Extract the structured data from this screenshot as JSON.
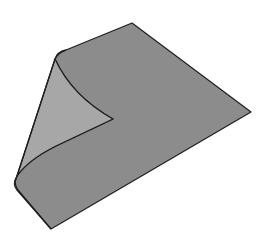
{
  "illustration": {
    "subject": "sheet with curled corner",
    "colors": {
      "background": "#ffffff",
      "top_surface": "#8c8c8c",
      "underside": "#a7a7a7",
      "outline": "#1e1e1e"
    }
  }
}
